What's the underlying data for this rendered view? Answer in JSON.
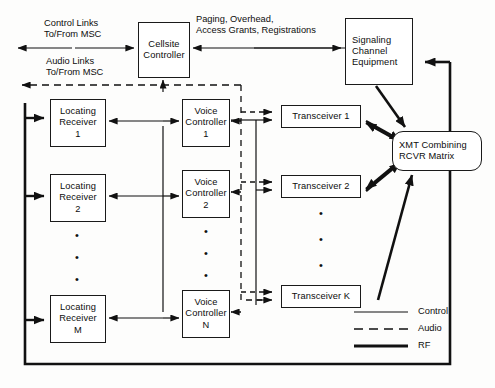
{
  "diagram": {
    "colors": {
      "ink": "#0d0d0d",
      "line": "#1a1a1a",
      "background": "#fdfdfc"
    },
    "nodes": {
      "cellsite_controller": {
        "line1": "Cellsite",
        "line2": "Controller"
      },
      "signaling_channel_equipment": {
        "line1": "Signaling",
        "line2": "Channel",
        "line3": "Equipment"
      },
      "xmt_matrix": {
        "line1": "XMT Combining",
        "line2": "RCVR Matrix"
      },
      "locating_receiver_1": {
        "line1": "Locating",
        "line2": "Receiver",
        "line3": "1"
      },
      "locating_receiver_2": {
        "line1": "Locating",
        "line2": "Receiver",
        "line3": "2"
      },
      "locating_receiver_m": {
        "line1": "Locating",
        "line2": "Receiver",
        "line3": "M"
      },
      "voice_controller_1": {
        "line1": "Voice",
        "line2": "Controller",
        "line3": "1"
      },
      "voice_controller_2": {
        "line1": "Voice",
        "line2": "Controller",
        "line3": "2"
      },
      "voice_controller_n": {
        "line1": "Voice",
        "line2": "Controller",
        "line3": "N"
      },
      "transceiver_1": {
        "line1": "Transceiver 1"
      },
      "transceiver_2": {
        "line1": "Transceiver 2"
      },
      "transceiver_k": {
        "line1": "Transceiver K"
      }
    },
    "labels": {
      "control_links": {
        "line1": "Control Links",
        "line2": "To/From MSC"
      },
      "audio_links": {
        "line1": "Audio Links",
        "line2": "To/From MSC"
      },
      "paging": {
        "line1": "Paging, Overhead,",
        "line2": "Access Grants, Registrations"
      }
    },
    "legend": {
      "items": [
        {
          "label": "Control",
          "style": "thin-solid"
        },
        {
          "label": "Audio",
          "style": "dashed"
        },
        {
          "label": "RF",
          "style": "thick-solid"
        }
      ]
    },
    "ellipses": {
      "glyph": "•",
      "count": 3
    }
  }
}
